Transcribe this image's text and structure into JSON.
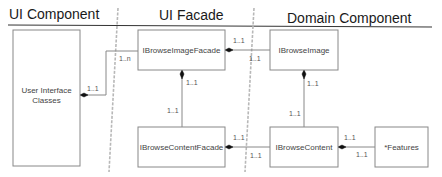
{
  "diagram": {
    "type": "uml-class-layered",
    "headers": [
      {
        "id": "ui-component",
        "label": "UI Component"
      },
      {
        "id": "ui-facade",
        "label": "UI Facade"
      },
      {
        "id": "domain-component",
        "label": "Domain Component"
      }
    ],
    "nodes": [
      {
        "id": "ui-classes",
        "label_line1": "User Interface",
        "label_line2": "Classes",
        "layer": "UI Component"
      },
      {
        "id": "ibrowse-image-facade",
        "label": "IBrowseImageFacade",
        "layer": "UI Facade"
      },
      {
        "id": "ibrowse-content-facade",
        "label": "IBrowseContentFacade",
        "layer": "UI Facade"
      },
      {
        "id": "ibrowse-image",
        "label": "IBrowseImage",
        "layer": "Domain Component"
      },
      {
        "id": "ibrowse-content",
        "label": "IBrowseContent",
        "layer": "Domain Component"
      },
      {
        "id": "features",
        "label": "*Features",
        "layer": "Domain Component"
      }
    ],
    "edges": [
      {
        "from": "ui-classes",
        "to": "ibrowse-image-facade",
        "kind": "composition",
        "from_mult": "1..1",
        "to_mult": "1..n"
      },
      {
        "from": "ibrowse-image-facade",
        "to": "ibrowse-content-facade",
        "kind": "composition",
        "from_mult": "1..1",
        "to_mult": "1..1"
      },
      {
        "from": "ibrowse-image-facade",
        "to": "ibrowse-image",
        "kind": "composition",
        "from_mult": "1..1",
        "to_mult": "1..1"
      },
      {
        "from": "ibrowse-content-facade",
        "to": "ibrowse-content",
        "kind": "composition",
        "from_mult": "1..1",
        "to_mult": "1..1"
      },
      {
        "from": "ibrowse-image",
        "to": "ibrowse-content",
        "kind": "composition",
        "from_mult": "1..1",
        "to_mult": "1..1"
      },
      {
        "from": "ibrowse-content",
        "to": "features",
        "kind": "composition",
        "from_mult": "1..1",
        "to_mult": "1..1"
      }
    ],
    "multiplicity_labels": {
      "ui_to_facade_near_ui": "1..1",
      "ui_to_facade_near_facade": "1..n",
      "imgfacade_to_contentfacade_top": "1..1",
      "imgfacade_to_contentfacade_bottom": "1..1",
      "imgfacade_to_image_left": "1..1",
      "imgfacade_to_image_right": "1..1",
      "contentfacade_to_content_left": "1..1",
      "contentfacade_to_content_right": "1..1",
      "image_to_content_top": "1..1",
      "image_to_content_bottom": "1..1",
      "content_to_features_top": "1..1",
      "content_to_features_bottom": "1..1"
    },
    "colors": {
      "line": "#888888",
      "diamond": "#111111",
      "divider": "#b8b8b8",
      "header_text": "#1a1a1a"
    }
  }
}
